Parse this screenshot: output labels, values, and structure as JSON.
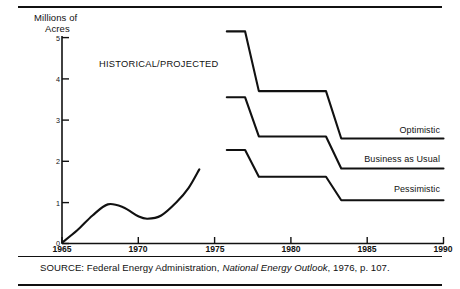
{
  "figure": {
    "axis_title_line1": "Millions of",
    "axis_title_line2": "Acres",
    "annotation": "HISTORICAL/PROJECTED",
    "source_prefix": "SOURCE:  Federal Energy Administration,",
    "source_italic": "National Energy Outlook",
    "source_suffix": ", 1976, p. 107."
  },
  "chart_data": {
    "type": "line",
    "title": "",
    "xlabel": "",
    "ylabel": "Millions of Acres",
    "xlim": [
      1965,
      1990
    ],
    "ylim": [
      0,
      5
    ],
    "xticks": [
      1965,
      1970,
      1975,
      1980,
      1985,
      1990
    ],
    "yticks": [
      0,
      1,
      2,
      3,
      4,
      5
    ],
    "grid": false,
    "legend": "inline-right-of-series",
    "annotations": [
      {
        "text": "HISTORICAL/PROJECTED",
        "x": 1972,
        "y": 4.3
      }
    ],
    "series": [
      {
        "name": "Historical",
        "label": "",
        "style": "smooth-curve",
        "points": [
          {
            "x": 1965.0,
            "y": 0.02
          },
          {
            "x": 1966.0,
            "y": 0.32
          },
          {
            "x": 1967.0,
            "y": 0.68
          },
          {
            "x": 1968.0,
            "y": 0.95
          },
          {
            "x": 1969.0,
            "y": 0.88
          },
          {
            "x": 1970.0,
            "y": 0.66
          },
          {
            "x": 1970.6,
            "y": 0.6
          },
          {
            "x": 1971.5,
            "y": 0.68
          },
          {
            "x": 1972.5,
            "y": 1.0
          },
          {
            "x": 1973.3,
            "y": 1.35
          },
          {
            "x": 1974.0,
            "y": 1.8
          }
        ]
      },
      {
        "name": "Optimistic",
        "label": "Optimistic",
        "style": "step",
        "points": [
          {
            "x": 1975.8,
            "y": 5.15
          },
          {
            "x": 1977.0,
            "y": 5.15
          },
          {
            "x": 1977.9,
            "y": 3.7
          },
          {
            "x": 1982.3,
            "y": 3.7
          },
          {
            "x": 1983.3,
            "y": 2.55
          },
          {
            "x": 1990.0,
            "y": 2.55
          }
        ]
      },
      {
        "name": "Business as Usual",
        "label": "Business as Usual",
        "style": "step",
        "points": [
          {
            "x": 1975.8,
            "y": 3.55
          },
          {
            "x": 1977.0,
            "y": 3.55
          },
          {
            "x": 1977.9,
            "y": 2.6
          },
          {
            "x": 1982.3,
            "y": 2.6
          },
          {
            "x": 1983.3,
            "y": 1.82
          },
          {
            "x": 1990.0,
            "y": 1.82
          }
        ]
      },
      {
        "name": "Pessimistic",
        "label": "Pessimistic",
        "style": "step",
        "points": [
          {
            "x": 1975.8,
            "y": 2.27
          },
          {
            "x": 1977.0,
            "y": 2.27
          },
          {
            "x": 1977.9,
            "y": 1.62
          },
          {
            "x": 1982.3,
            "y": 1.62
          },
          {
            "x": 1983.3,
            "y": 1.05
          },
          {
            "x": 1990.0,
            "y": 1.05
          }
        ]
      }
    ]
  }
}
